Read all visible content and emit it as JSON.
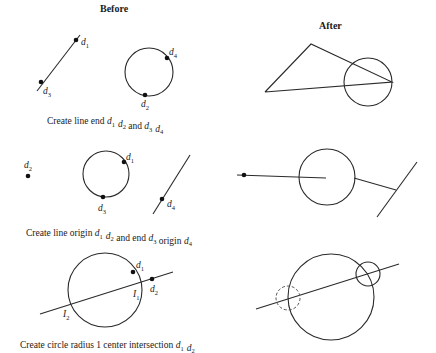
{
  "headers": {
    "before": "Before",
    "after": "After"
  },
  "rows": [
    {
      "caption": {
        "text": "Create line end ",
        "parts": [
          "d",
          "1",
          " ",
          "d",
          "2",
          " and ",
          "d",
          "3",
          " ",
          "d",
          "4"
        ]
      },
      "caption_plain": "Create line end d1 d2 and d3 d4",
      "before": {
        "lines": [
          {
            "x1": 37,
            "y1": 91,
            "x2": 80,
            "y2": 35
          }
        ],
        "circles": [
          {
            "cx": 149,
            "cy": 72,
            "r": 24
          }
        ],
        "points": [
          {
            "x": 76,
            "y": 40,
            "label": "d",
            "sub": "1",
            "lx": 81,
            "ly": 45
          },
          {
            "x": 41,
            "y": 82,
            "label": "d",
            "sub": "3",
            "lx": 43,
            "ly": 94
          },
          {
            "x": 167,
            "y": 58,
            "label": "d",
            "sub": "4",
            "lx": 169,
            "ly": 55
          },
          {
            "x": 145,
            "y": 95,
            "label": "d",
            "sub": "2",
            "lx": 141,
            "ly": 107
          }
        ]
      },
      "after": {
        "polylines": [
          {
            "points": "265,92 311,44 392,82 265,92"
          }
        ],
        "circles": [
          {
            "cx": 368,
            "cy": 82,
            "r": 24
          }
        ]
      }
    },
    {
      "caption_plain": "Create line origin d1 d2 and end d3 origin d4",
      "before": {
        "lines": [
          {
            "x1": 153,
            "y1": 214,
            "x2": 190,
            "y2": 155
          }
        ],
        "circles": [
          {
            "cx": 106,
            "cy": 174,
            "r": 23
          }
        ],
        "points": [
          {
            "x": 28,
            "y": 176,
            "label": "d",
            "sub": "2",
            "lx": 24,
            "ly": 168
          },
          {
            "x": 124,
            "y": 162,
            "label": "d",
            "sub": "1",
            "lx": 126,
            "ly": 160
          },
          {
            "x": 103,
            "y": 197,
            "label": "d",
            "sub": "3",
            "lx": 98,
            "ly": 211
          },
          {
            "x": 162,
            "y": 199,
            "label": "d",
            "sub": "4",
            "lx": 167,
            "ly": 207
          }
        ]
      },
      "after": {
        "lines": [
          {
            "x1": 237,
            "y1": 175,
            "x2": 326,
            "y2": 178
          },
          {
            "x1": 354,
            "y1": 178,
            "x2": 396,
            "y2": 190
          },
          {
            "x1": 377,
            "y1": 217,
            "x2": 417,
            "y2": 162
          }
        ],
        "circles": [
          {
            "cx": 327,
            "cy": 177,
            "r": 28
          }
        ],
        "points": [
          {
            "x": 244,
            "y": 175
          }
        ]
      }
    },
    {
      "caption_plain": "Create circle radius 1 center intersection d1 d2",
      "before": {
        "lines": [
          {
            "x1": 40,
            "y1": 314,
            "x2": 173,
            "y2": 272
          }
        ],
        "circles": [
          {
            "cx": 105,
            "cy": 290,
            "r": 37
          }
        ],
        "points": [
          {
            "x": 133,
            "y": 272,
            "label": "d",
            "sub": "1",
            "lx": 136,
            "ly": 268
          },
          {
            "x": 152,
            "y": 279,
            "label": "d",
            "sub": "2",
            "lx": 150,
            "ly": 292
          }
        ],
        "labels": [
          {
            "label": "I",
            "sub": "1",
            "lx": 133,
            "ly": 297
          },
          {
            "label": "I",
            "sub": "2",
            "lx": 63,
            "ly": 317
          }
        ]
      },
      "after": {
        "lines": [
          {
            "x1": 256,
            "y1": 309,
            "x2": 399,
            "y2": 264
          }
        ],
        "circles": [
          {
            "cx": 331,
            "cy": 297,
            "r": 43,
            "style": "solid"
          },
          {
            "cx": 368,
            "cy": 274,
            "r": 12,
            "style": "solid"
          },
          {
            "cx": 288,
            "cy": 298,
            "r": 12,
            "style": "dashed"
          }
        ]
      }
    }
  ],
  "captions": [
    {
      "pre": "Create line end ",
      "segs": [
        [
          "d",
          "1"
        ],
        [
          "d",
          "2"
        ],
        [
          " and ",
          ""
        ],
        [
          "d",
          "3"
        ],
        [
          "d",
          "4"
        ]
      ]
    },
    {
      "pre": "Create line origin ",
      "segs": [
        [
          "d",
          "1"
        ],
        [
          "d",
          "2"
        ],
        [
          " and end ",
          ""
        ],
        [
          "d",
          "3"
        ],
        [
          " origin ",
          ""
        ],
        [
          "d",
          "4"
        ]
      ]
    },
    {
      "pre": "Create circle radius 1 center intersection ",
      "segs": [
        [
          "d",
          "1"
        ],
        [
          "d",
          "2"
        ]
      ]
    }
  ],
  "caption_positions": [
    {
      "x": 47,
      "y": 124
    },
    {
      "x": 26,
      "y": 236
    },
    {
      "x": 20,
      "y": 348
    }
  ]
}
